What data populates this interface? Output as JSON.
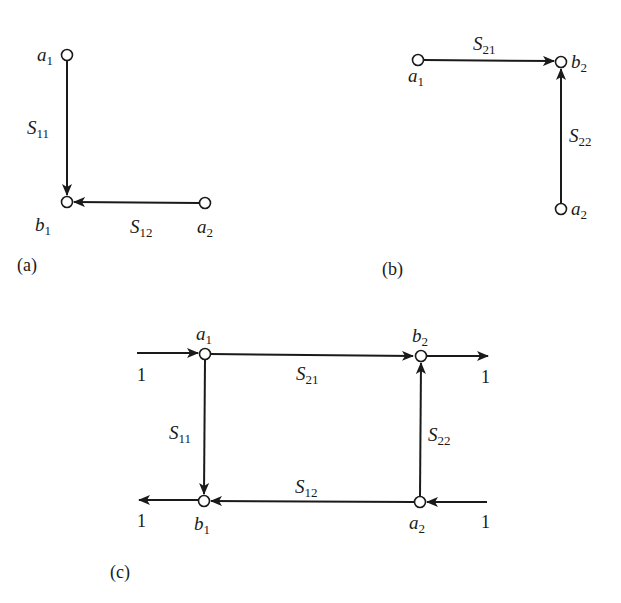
{
  "figure": {
    "panels": [
      {
        "caption": "(a)",
        "nodes": [
          {
            "id": "a1",
            "var": "a",
            "sub": "1"
          },
          {
            "id": "b1",
            "var": "b",
            "sub": "1"
          },
          {
            "id": "a2",
            "var": "a",
            "sub": "2"
          }
        ],
        "edges": [
          {
            "from": "a1",
            "to": "b1",
            "var": "S",
            "sub": "11"
          },
          {
            "from": "a2",
            "to": "b1",
            "var": "S",
            "sub": "12"
          }
        ]
      },
      {
        "caption": "(b)",
        "nodes": [
          {
            "id": "a1",
            "var": "a",
            "sub": "1"
          },
          {
            "id": "b2",
            "var": "b",
            "sub": "2"
          },
          {
            "id": "a2",
            "var": "a",
            "sub": "2"
          }
        ],
        "edges": [
          {
            "from": "a1",
            "to": "b2",
            "var": "S",
            "sub": "21"
          },
          {
            "from": "a2",
            "to": "b2",
            "var": "S",
            "sub": "22"
          }
        ]
      },
      {
        "caption": "(c)",
        "nodes": [
          {
            "id": "a1",
            "var": "a",
            "sub": "1"
          },
          {
            "id": "b2",
            "var": "b",
            "sub": "2"
          },
          {
            "id": "b1",
            "var": "b",
            "sub": "1"
          },
          {
            "id": "a2",
            "var": "a",
            "sub": "2"
          }
        ],
        "edges": [
          {
            "from": "a1",
            "to": "b2",
            "var": "S",
            "sub": "21"
          },
          {
            "from": "a1",
            "to": "b1",
            "var": "S",
            "sub": "11"
          },
          {
            "from": "a2",
            "to": "b2",
            "var": "S",
            "sub": "22"
          },
          {
            "from": "a2",
            "to": "b1",
            "var": "S",
            "sub": "12"
          }
        ],
        "ports": [
          {
            "id": "in-a1",
            "to": "a1",
            "label": "1"
          },
          {
            "id": "out-b2",
            "from": "b2",
            "label": "1"
          },
          {
            "id": "out-b1",
            "from": "b1",
            "label": "1"
          },
          {
            "id": "in-a2",
            "to": "a2",
            "label": "1"
          }
        ]
      }
    ]
  }
}
